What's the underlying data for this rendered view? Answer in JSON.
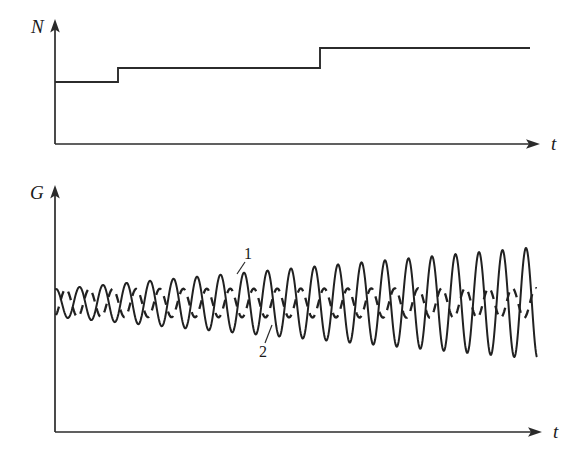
{
  "figure": {
    "background_color": "#ffffff",
    "ink_color": "#2b2b2b",
    "width": 581,
    "height": 467
  },
  "panels": [
    {
      "id": "panel-n",
      "y_axis_label": "N",
      "x_axis_label": "t",
      "axis_origin": [
        55,
        144
      ],
      "y_axis_top": [
        55,
        22
      ],
      "x_axis_end": [
        538,
        144
      ]
    },
    {
      "id": "panel-g",
      "y_axis_label": "G",
      "x_axis_label": "t",
      "axis_origin": [
        55,
        432
      ],
      "y_axis_top": [
        55,
        188
      ],
      "x_axis_end": [
        540,
        432
      ]
    }
  ],
  "curve_labels": [
    {
      "text": "1",
      "x": 248,
      "y": 258,
      "describes": "solid growing oscillation"
    },
    {
      "text": "2",
      "x": 262,
      "y": 356,
      "describes": "dashed constant oscillation"
    }
  ],
  "chart_data": [
    {
      "type": "line",
      "id": "N-step-plot",
      "title": "",
      "xlabel": "t",
      "ylabel": "N",
      "grid": false,
      "legend": false,
      "axis_style": "arrow-axes, no tick marks, no numeric tick labels",
      "description": "Monotone staircase: N stays constant then jumps up twice",
      "step_function": {
        "x_breaks": [
          55,
          118,
          320,
          530
        ],
        "levels_px_y": [
          82,
          68,
          48
        ],
        "levels_relative": [
          1,
          2,
          3
        ],
        "segments": [
          {
            "x_start": 55,
            "x_end": 118,
            "y": 82,
            "level": 1
          },
          {
            "x_start": 118,
            "x_end": 320,
            "y": 68,
            "level": 2
          },
          {
            "x_start": 320,
            "x_end": 530,
            "y": 48,
            "level": 3
          }
        ]
      },
      "xlim": [
        55,
        538
      ],
      "ylim": [
        144,
        22
      ]
    },
    {
      "type": "line",
      "id": "G-oscillation-plot",
      "title": "",
      "xlabel": "t",
      "ylabel": "G",
      "grid": false,
      "legend": false,
      "axis_style": "arrow-axes, no tick marks, no numeric tick labels",
      "description": "Two superposed oscillations sharing a baseline: curve 1 (solid) grows in amplitude with time, curve 2 (dashed) keeps a constant small amplitude",
      "baseline_y_px": 303,
      "x_start": 56,
      "x_end": 537,
      "series": [
        {
          "name": "1",
          "style": "solid",
          "period_px": 23.5,
          "phase_deg": 90,
          "amplitude_start_px": 14,
          "amplitude_end_px": 56,
          "amplitude_growth": "linear",
          "label": "1"
        },
        {
          "name": "2",
          "style": "dashed",
          "period_px": 23.5,
          "phase_deg": -60,
          "amplitude_start_px": 14,
          "amplitude_end_px": 15,
          "amplitude_growth": "constant",
          "label": "2"
        }
      ],
      "xlim": [
        55,
        540
      ],
      "ylim": [
        432,
        188
      ]
    }
  ]
}
